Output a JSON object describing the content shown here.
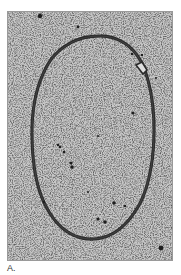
{
  "figure": {
    "panel_label": "A.",
    "image": {
      "description": "electron micrograph of a closed circular molecule (oval loop) on a granular background",
      "background_color": "#c4c4c4",
      "strand_color": "#2a2a2a",
      "particle_color": "#1e1e1e"
    }
  }
}
